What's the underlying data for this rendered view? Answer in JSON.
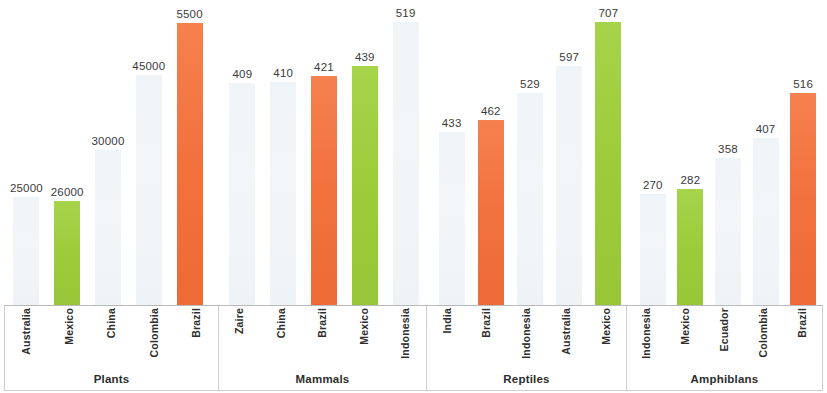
{
  "chart_data": {
    "type": "bar",
    "title": "",
    "subtitle": "",
    "xlabel": "",
    "ylabel": "",
    "grid": false,
    "legend": "none",
    "note": "Grouped bar chart of species counts by country for four taxonomic groups. Each group has its own implicit vertical scale; bars are labelled with their value above the bar.",
    "colors": {
      "pale": "#EEF3F7",
      "green": "#9CCB3B",
      "orange": "#F1713D",
      "axis": "#B9B9B9",
      "frame": "#CFCFCF",
      "text": "#2D2D2D"
    },
    "groups": [
      {
        "name": "Plants",
        "ymax": 57000,
        "categories": [
          "Australia",
          "Mexico",
          "China",
          "Colombia",
          "Brazil"
        ],
        "values": [
          25000,
          26000,
          30000,
          45000,
          5500
        ],
        "value_labels": [
          "25000",
          "26000",
          "30000",
          "45000",
          "5500"
        ],
        "bar_heights": [
          108,
          104,
          155,
          230,
          282
        ],
        "colors": [
          "pale",
          "green",
          "pale",
          "pale",
          "orange"
        ]
      },
      {
        "name": "Mammals",
        "ymax": 560,
        "categories": [
          "Zaire",
          "China",
          "Brazil",
          "Mexico",
          "Indonesia"
        ],
        "values": [
          409,
          410,
          421,
          439,
          519
        ],
        "value_labels": [
          "409",
          "410",
          "421",
          "439",
          "519"
        ],
        "bar_heights": [
          222,
          223,
          229,
          239,
          283
        ],
        "colors": [
          "pale",
          "pale",
          "orange",
          "green",
          "pale"
        ]
      },
      {
        "name": "Reptiles",
        "ymax": 760,
        "categories": [
          "India",
          "Brazil",
          "Indonesia",
          "Australia",
          "Mexico"
        ],
        "values": [
          433,
          462,
          529,
          597,
          707
        ],
        "value_labels": [
          "433",
          "462",
          "529",
          "597",
          "707"
        ],
        "bar_heights": [
          173,
          185,
          212,
          239,
          283
        ],
        "colors": [
          "pale",
          "orange",
          "pale",
          "pale",
          "green"
        ]
      },
      {
        "name": "Amphiblans",
        "ymax": 560,
        "categories": [
          "Indonesia",
          "Mexico",
          "Ecuador",
          "Colombia",
          "Brazil"
        ],
        "values": [
          270,
          282,
          358,
          407,
          516
        ],
        "value_labels": [
          "270",
          "282",
          "358",
          "407",
          "516"
        ],
        "bar_heights": [
          111,
          116,
          147,
          167,
          212
        ],
        "colors": [
          "pale",
          "green",
          "pale",
          "pale",
          "orange"
        ]
      }
    ]
  }
}
